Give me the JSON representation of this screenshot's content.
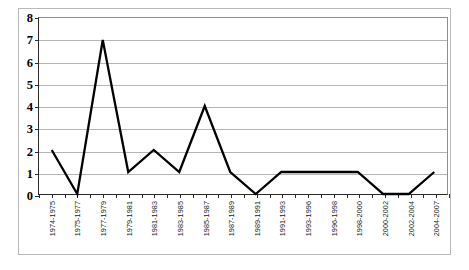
{
  "chart_data": {
    "type": "line",
    "title": "",
    "subtitle": "",
    "xlabel": "",
    "ylabel": "",
    "categories": [
      "1974-1975",
      "1975-1977",
      "1977-1979",
      "1979-1981",
      "1981-1983",
      "1983-1985",
      "1985-1987",
      "1987-1989",
      "1989-1991",
      "1991-1993",
      "1993-1996",
      "1996-1998",
      "1998-2000",
      "2000-2002",
      "2002-2004",
      "2004-2007"
    ],
    "values": [
      2,
      0,
      7,
      1,
      2,
      1,
      4,
      1,
      0,
      1,
      1,
      1,
      1,
      0,
      0,
      1
    ],
    "ylim": [
      0,
      8
    ],
    "ytick_labels": [
      "0",
      "1",
      "2",
      "3",
      "4",
      "5",
      "6",
      "7",
      "8"
    ],
    "ytick_values": [
      0,
      1,
      2,
      3,
      4,
      5,
      6,
      7,
      8
    ],
    "grid": true,
    "grid_axis": "y",
    "legend": false,
    "legend_position": "none",
    "series_color": "#000000",
    "grid_color": "#b5b5b5",
    "axis_color": "#2a2a2a",
    "background_color": "#ffffff"
  }
}
